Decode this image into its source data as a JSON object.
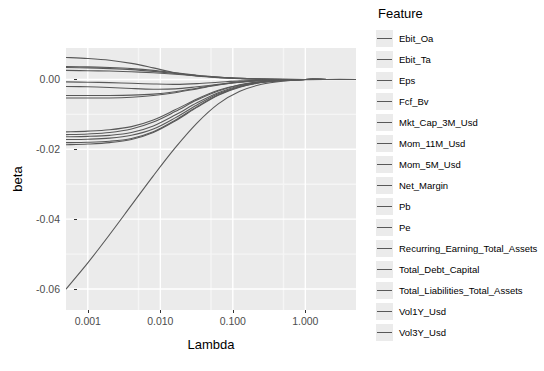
{
  "chart_data": {
    "type": "line",
    "title": "",
    "xlabel": "Lambda",
    "ylabel": "beta",
    "xscale": "log",
    "xlim": [
      0.0005,
      5.0
    ],
    "ylim": [
      -0.066,
      0.009
    ],
    "grid": true,
    "legend_position": "right",
    "legend_title": "Feature",
    "x_ticks": [
      {
        "value": 0.001,
        "label": "0.001"
      },
      {
        "value": 0.01,
        "label": "0.010"
      },
      {
        "value": 0.1,
        "label": "0.100"
      },
      {
        "value": 1.0,
        "label": "1.000"
      }
    ],
    "y_ticks": [
      {
        "value": 0.0,
        "label": "0.00"
      },
      {
        "value": -0.02,
        "label": "-0.02"
      },
      {
        "value": -0.04,
        "label": "-0.04"
      },
      {
        "value": -0.06,
        "label": "-0.06"
      }
    ],
    "x": [
      0.0005,
      0.001,
      0.002,
      0.004,
      0.008,
      0.016,
      0.032,
      0.063,
      0.125,
      0.25,
      0.5,
      1.0,
      2.0,
      5.0
    ],
    "series": [
      {
        "name": "Ebit_Oa",
        "values": [
          0.0063,
          0.006,
          0.0055,
          0.0046,
          0.0033,
          0.0019,
          0.001,
          0.0005,
          0.0002,
          0.0001,
          0.0,
          0.0,
          0.0,
          0.0
        ]
      },
      {
        "name": "Ebit_Ta",
        "values": [
          0.0037,
          0.0036,
          0.0034,
          0.0031,
          0.0026,
          0.0019,
          0.0012,
          0.0007,
          0.0003,
          0.0001,
          0.0001,
          0.0,
          0.0,
          0.0
        ]
      },
      {
        "name": "Eps",
        "values": [
          0.0034,
          0.0033,
          0.0031,
          0.0028,
          0.0023,
          0.0017,
          0.0011,
          0.0006,
          0.0003,
          0.0001,
          0.0,
          0.0,
          0.0,
          0.0
        ]
      },
      {
        "name": "Fcf_Bv",
        "values": [
          0.0026,
          0.0025,
          0.0024,
          0.0022,
          0.0019,
          0.0015,
          0.001,
          0.0006,
          0.0003,
          0.0001,
          0.0,
          0.0,
          0.0,
          0.0
        ]
      },
      {
        "name": "Mkt_Cap_3M_Usd",
        "values": [
          -0.0007,
          -0.0008,
          -0.0009,
          -0.0011,
          -0.0013,
          -0.0014,
          -0.0012,
          -0.0008,
          -0.0004,
          -0.0002,
          -0.0001,
          0.0,
          0.0,
          0.0
        ]
      },
      {
        "name": "Mom_11M_Usd",
        "values": [
          -0.002,
          -0.0021,
          -0.0023,
          -0.0026,
          -0.0028,
          -0.0027,
          -0.0021,
          -0.0014,
          -0.0007,
          -0.0003,
          -0.0001,
          0.0,
          0.0,
          0.0
        ]
      },
      {
        "name": "Mom_5M_Usd",
        "values": [
          -0.0046,
          -0.0046,
          -0.0046,
          -0.0045,
          -0.0042,
          -0.0035,
          -0.0025,
          -0.0015,
          -0.0008,
          -0.0003,
          -0.0001,
          0.0,
          0.0,
          0.0
        ]
      },
      {
        "name": "Net_Margin",
        "values": [
          -0.0053,
          -0.0053,
          -0.0053,
          -0.0051,
          -0.0046,
          -0.0038,
          -0.0027,
          -0.0016,
          -0.0008,
          -0.0003,
          -0.0001,
          0.0,
          0.0,
          0.0
        ]
      },
      {
        "name": "Pb",
        "values": [
          -0.015,
          -0.0148,
          -0.0144,
          -0.0135,
          -0.0116,
          -0.0087,
          -0.0056,
          -0.0031,
          -0.0015,
          -0.0006,
          -0.0002,
          0.0,
          0.0,
          0.0
        ]
      },
      {
        "name": "Pe",
        "values": [
          -0.0158,
          -0.0156,
          -0.0152,
          -0.0142,
          -0.0122,
          -0.0092,
          -0.0059,
          -0.0033,
          -0.0016,
          -0.0007,
          -0.0002,
          0.0,
          0.0,
          0.0
        ]
      },
      {
        "name": "Recurring_Earning_Total_Assets",
        "values": [
          -0.0164,
          -0.0163,
          -0.016,
          -0.0152,
          -0.0133,
          -0.0102,
          -0.0067,
          -0.0038,
          -0.0018,
          -0.0007,
          -0.0002,
          0.0,
          0.0,
          0.0
        ]
      },
      {
        "name": "Total_Debt_Capital",
        "values": [
          -0.0172,
          -0.0171,
          -0.0168,
          -0.016,
          -0.0142,
          -0.011,
          -0.0073,
          -0.0041,
          -0.002,
          -0.0008,
          -0.0003,
          0.0,
          0.0,
          0.0
        ]
      },
      {
        "name": "Total_Liabilities_Total_Assets",
        "values": [
          -0.0181,
          -0.018,
          -0.0177,
          -0.0169,
          -0.015,
          -0.0117,
          -0.0078,
          -0.0044,
          -0.0021,
          -0.0008,
          -0.0003,
          0.0,
          0.0,
          0.0
        ]
      },
      {
        "name": "Vol1Y_Usd",
        "values": [
          -0.0187,
          -0.0185,
          -0.0181,
          -0.0172,
          -0.0152,
          -0.0119,
          -0.008,
          -0.0045,
          -0.0022,
          -0.0009,
          -0.0003,
          0.0,
          0.0,
          0.0
        ]
      },
      {
        "name": "Vol3Y_Usd",
        "values": [
          -0.06,
          -0.0525,
          -0.0444,
          -0.036,
          -0.0276,
          -0.0196,
          -0.0125,
          -0.007,
          -0.0034,
          -0.0014,
          -0.0005,
          -0.0001,
          0.0,
          0.0
        ]
      }
    ],
    "colors": {
      "panel_background": "#ebebeb",
      "gridline_major": "#ffffff",
      "gridline_minor": "#f5f5f5",
      "line": "#595959",
      "axis_text": "#4d4d4d",
      "title_text": "#000000"
    }
  },
  "legend": {
    "title": "Feature",
    "items": [
      {
        "label": "Ebit_Oa"
      },
      {
        "label": "Ebit_Ta"
      },
      {
        "label": "Eps"
      },
      {
        "label": "Fcf_Bv"
      },
      {
        "label": "Mkt_Cap_3M_Usd"
      },
      {
        "label": "Mom_11M_Usd"
      },
      {
        "label": "Mom_5M_Usd"
      },
      {
        "label": "Net_Margin"
      },
      {
        "label": "Pb"
      },
      {
        "label": "Pe"
      },
      {
        "label": "Recurring_Earning_Total_Assets"
      },
      {
        "label": "Total_Debt_Capital"
      },
      {
        "label": "Total_Liabilities_Total_Assets"
      },
      {
        "label": "Vol1Y_Usd"
      },
      {
        "label": "Vol3Y_Usd"
      }
    ]
  }
}
